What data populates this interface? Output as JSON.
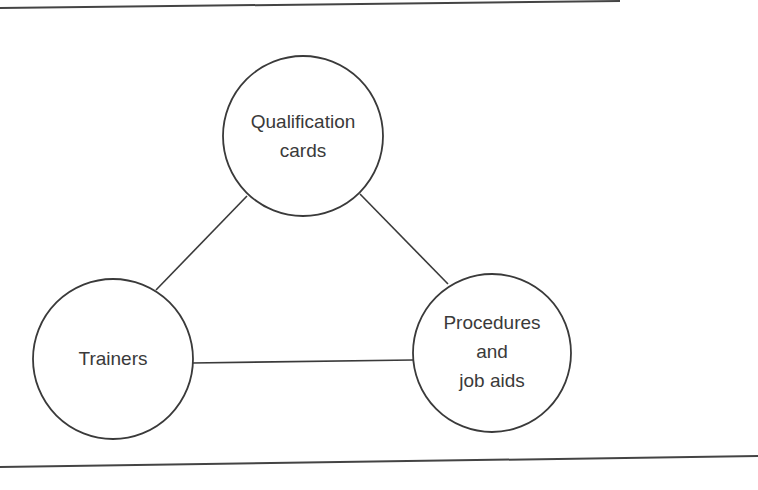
{
  "diagram": {
    "type": "triangle-of-nodes",
    "colors": {
      "stroke": "#3a3a3a",
      "text": "#3a3a3a",
      "background": "#ffffff"
    },
    "nodes": [
      {
        "id": "qualification",
        "lines": [
          "Qualification",
          "cards"
        ]
      },
      {
        "id": "trainers",
        "lines": [
          "Trainers"
        ]
      },
      {
        "id": "procedures",
        "lines": [
          "Procedures",
          "and",
          "job aids"
        ]
      }
    ],
    "edges": [
      {
        "from": "trainers",
        "to": "qualification"
      },
      {
        "from": "qualification",
        "to": "procedures"
      },
      {
        "from": "trainers",
        "to": "procedures"
      }
    ]
  }
}
